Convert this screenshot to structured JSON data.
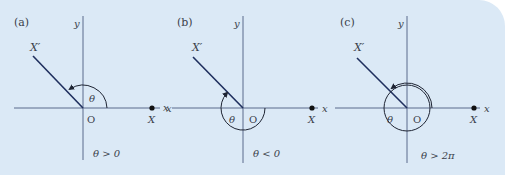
{
  "figure": {
    "background_color": "#dbe9f6",
    "axis_color": "#5a6b8c",
    "ray_color": "#1f2f5e",
    "arc_color": "#1e2433",
    "panels": [
      {
        "label": "(a)",
        "y_axis_label": "y",
        "x_axis_label": "x",
        "terminal_label": "X′",
        "initial_label": "X",
        "origin_label": "O",
        "angle_label": "θ",
        "condition": "θ > 0",
        "rotation": "counterclockwise"
      },
      {
        "label": "(b)",
        "y_axis_label": "y",
        "x_axis_label": "x",
        "neg_x_label": "x",
        "terminal_label": "X′",
        "initial_label": "X",
        "origin_label": "O",
        "angle_label": "θ",
        "condition": "θ < 0",
        "rotation": "clockwise"
      },
      {
        "label": "(c)",
        "y_axis_label": "y",
        "x_axis_label": "x",
        "terminal_label": "X′",
        "initial_label": "X",
        "origin_label": "O",
        "angle_label": "θ",
        "condition": "θ > 2π",
        "rotation": "counterclockwise, more than one full turn"
      }
    ]
  }
}
